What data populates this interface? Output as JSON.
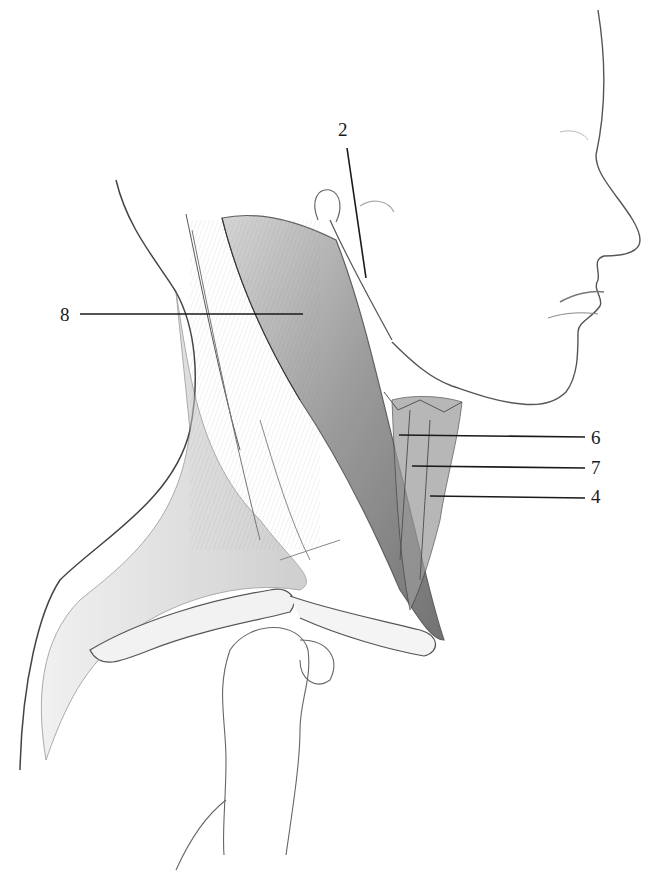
{
  "figure": {
    "background_color": "#ffffff",
    "line_color": "#1a1a1a",
    "labels": [
      {
        "id": "2",
        "text": "2",
        "x": 338,
        "y": 120,
        "leader": [
          347,
          148,
          366,
          278
        ]
      },
      {
        "id": "8",
        "text": "8",
        "x": 60,
        "y": 305,
        "leader": [
          80,
          314,
          303,
          314
        ]
      },
      {
        "id": "6",
        "text": "6",
        "x": 591,
        "y": 428,
        "leader": [
          399,
          435,
          585,
          437
        ]
      },
      {
        "id": "7",
        "text": "7",
        "x": 591,
        "y": 458,
        "leader": [
          412,
          466,
          585,
          468
        ]
      },
      {
        "id": "4",
        "text": "4",
        "x": 591,
        "y": 487,
        "leader": [
          430,
          496,
          585,
          498
        ]
      }
    ]
  }
}
